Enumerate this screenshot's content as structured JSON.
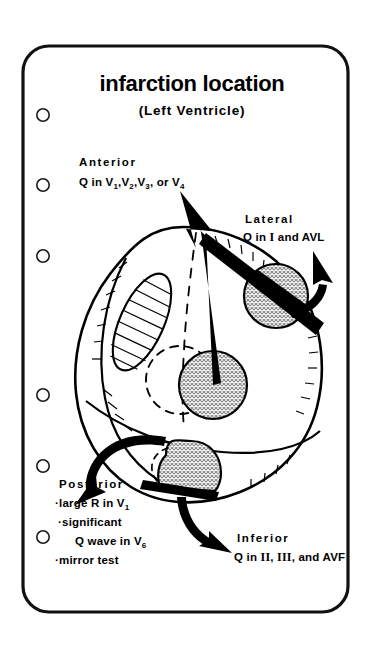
{
  "page": {
    "width": 372,
    "height": 645,
    "background_color": "#ffffff",
    "border_color": "#000000",
    "card_fill": "#ffffff"
  },
  "header": {
    "title": "infarction location",
    "subtitle": "(Left Ventricle)"
  },
  "binder_holes": {
    "count": 6,
    "label": "binder-hole"
  },
  "labels": {
    "anterior": {
      "heading": "Anterior",
      "line_prefix": "Q in ",
      "leads": [
        "V1",
        "V2",
        "V3",
        "V4"
      ],
      "line_full": "Q in V1,V2,V3, or V4",
      "conjunction": ", or "
    },
    "lateral": {
      "heading": "Lateral",
      "line_full": "Q in I and AVL",
      "leads": [
        "I",
        "AVL"
      ]
    },
    "inferior": {
      "heading": "Inferior",
      "line_full": "Q in II, III, and AVF",
      "leads": [
        "II",
        "III",
        "AVF"
      ]
    },
    "posterior": {
      "heading": "Posterior",
      "bullets": [
        "large R in V1",
        "significant",
        "Q wave in V6",
        "mirror  test"
      ],
      "bullet_char": "·"
    }
  },
  "diagram": {
    "type": "left-ventricle-infarction-map",
    "heart_outline_color": "#000000",
    "lesion_fill": "#cfcfcf",
    "arrow_color": "#000000",
    "dashed_color": "#000000",
    "regions": [
      {
        "name": "anterior",
        "style": "stippled-circle",
        "arrow": "up-left"
      },
      {
        "name": "lateral",
        "style": "stippled-circle-with-black-band",
        "arrow": "up-right"
      },
      {
        "name": "inferior",
        "style": "stippled-dome-with-black-base",
        "arrow": "down-right"
      },
      {
        "name": "posterior",
        "style": "dashed-circle",
        "arrow": "down-left"
      }
    ],
    "features": [
      {
        "name": "hatched-ellipse",
        "description": "tilted hatched oval on upper-left wall"
      },
      {
        "name": "septal-dashed-line",
        "description": "dashed groove line down the middle"
      },
      {
        "name": "dashed-cavity-circle",
        "description": "dashed circle behind central lesion"
      }
    ]
  }
}
